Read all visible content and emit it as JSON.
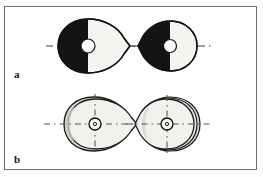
{
  "figure": {
    "background_color": "#ffffff",
    "frame_color": "#6e6e6e",
    "ink_color": "#111111",
    "fill_dark": "#141414",
    "fill_light": "#f2f2ef",
    "shade_gray": "#c9c9c4",
    "axis_color": "#3a3a3a"
  },
  "panels": [
    {
      "id": "a",
      "label": "a",
      "description": "Two ovoid sections with half-black, half-white fill and central circular hole on a horizontal dashed axis",
      "shapes": [
        {
          "id": "a1",
          "name": "ovoid-half-filled-left",
          "center_x": 88,
          "center_y": 46,
          "radius_x": 30,
          "radius_y": 27,
          "point_side": "right",
          "dark_half": "left",
          "hole_radius": 7,
          "axes": [
            "horizontal"
          ]
        },
        {
          "id": "a2",
          "name": "ovoid-half-filled-right",
          "center_x": 170,
          "center_y": 46,
          "radius_x": 27,
          "radius_y": 25,
          "point_side": "left",
          "dark_half": "left",
          "hole_radius": 6,
          "axes": [
            "horizontal"
          ]
        }
      ]
    },
    {
      "id": "b",
      "label": "b",
      "description": "Two outlined ovoid sections with light fill, crescent shading, nested contours and crosshair dashed axes",
      "shapes": [
        {
          "id": "b1",
          "name": "ovoid-outline-left",
          "center_x": 95,
          "center_y": 124,
          "radius_x": 29,
          "radius_y": 26,
          "point_side": "right",
          "contours": 2,
          "hole_radius": 6,
          "axes": [
            "horizontal",
            "vertical"
          ]
        },
        {
          "id": "b2",
          "name": "ovoid-outline-right",
          "center_x": 170,
          "center_y": 124,
          "radius_x": 28,
          "radius_y": 26,
          "point_side": "left",
          "contours": 3,
          "hole_radius": 6,
          "axes": [
            "horizontal",
            "vertical"
          ]
        }
      ]
    }
  ]
}
